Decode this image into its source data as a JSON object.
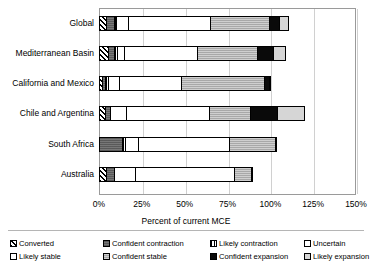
{
  "chart": {
    "type": "bar",
    "title": "",
    "xlabel": "Percent of current MCE",
    "ylabel": "",
    "orientation": "horizontal-stacked"
  },
  "axis": {
    "x_ticks": [
      "0%",
      "25%",
      "50%",
      "75%",
      "100%",
      "125%",
      "150%"
    ],
    "x_tick_values": [
      0,
      25,
      50,
      75,
      100,
      125,
      150
    ],
    "xlim": [
      0,
      150
    ],
    "grid": "vertical"
  },
  "legend": {
    "items": [
      {
        "label": "Converted",
        "key": "converted",
        "pattern": "diagonal-hatch",
        "color": "#ffffff"
      },
      {
        "label": "Confident contraction",
        "key": "confident_contraction",
        "pattern": "dark-gray-fine",
        "color": "#777777"
      },
      {
        "label": "Likely contraction",
        "key": "likely_contraction",
        "pattern": "vertical-hatch",
        "color": "#ffffff"
      },
      {
        "label": "Uncertain",
        "key": "uncertain",
        "pattern": "solid-white",
        "color": "#ffffff"
      },
      {
        "label": "Likely stable",
        "key": "likely_stable",
        "pattern": "solid-white",
        "color": "#ffffff"
      },
      {
        "label": "Confident stable",
        "key": "confident_stable",
        "pattern": "mid-gray-fine",
        "color": "#a8a8a8"
      },
      {
        "label": "Confident expansion",
        "key": "confident_expansion",
        "pattern": "solid-black",
        "color": "#0a0a0a"
      },
      {
        "label": "Likely expansion",
        "key": "likely_expansion",
        "pattern": "light-gray",
        "color": "#d6d6d6"
      }
    ]
  },
  "chart_data": {
    "type": "bar",
    "title": "",
    "xlabel": "Percent of current MCE",
    "ylabel": "",
    "xlim": [
      0,
      150
    ],
    "grid": true,
    "legend_position": "bottom",
    "stacked": true,
    "orientation": "horizontal",
    "categories": [
      "Global",
      "Mediterranean Basin",
      "California and Mexico",
      "Chile and Argentina",
      "South Africa",
      "Australia"
    ],
    "series": [
      {
        "name": "Converted",
        "values": [
          4.0,
          5.0,
          2.0,
          3.5,
          0.0,
          4.0
        ]
      },
      {
        "name": "Confident contraction",
        "values": [
          4.5,
          4.0,
          1.5,
          3.0,
          13.5,
          5.0
        ]
      },
      {
        "name": "Likely contraction",
        "values": [
          1.5,
          1.5,
          1.5,
          0.0,
          1.5,
          0.0
        ]
      },
      {
        "name": "Uncertain",
        "values": [
          7.0,
          4.0,
          6.5,
          9.0,
          8.0,
          12.0
        ]
      },
      {
        "name": "Likely stable",
        "values": [
          48.0,
          43.0,
          36.5,
          48.5,
          53.0,
          58.0
        ]
      },
      {
        "name": "Confident stable",
        "values": [
          34.0,
          35.0,
          48.5,
          24.0,
          26.5,
          9.5
        ]
      },
      {
        "name": "Confident expansion",
        "values": [
          6.0,
          9.0,
          2.5,
          16.0,
          1.0,
          1.5
        ]
      },
      {
        "name": "Likely expansion",
        "values": [
          6.0,
          7.5,
          1.0,
          16.0,
          0.0,
          0.0
        ]
      }
    ],
    "totals": [
      111.0,
      109.0,
      100.0,
      140.0,
      103.5,
      90.0
    ]
  },
  "bars": [
    {
      "category": "Global",
      "segments": [
        {
          "key": "converted",
          "value": 4.0
        },
        {
          "key": "confident_contraction",
          "value": 4.5
        },
        {
          "key": "likely_contraction",
          "value": 1.5
        },
        {
          "key": "uncertain",
          "value": 7.0
        },
        {
          "key": "likely_stable",
          "value": 48.0
        },
        {
          "key": "confident_stable",
          "value": 34.0
        },
        {
          "key": "confident_expansion",
          "value": 6.0
        },
        {
          "key": "likely_expansion",
          "value": 6.0
        }
      ]
    },
    {
      "category": "Mediterranean Basin",
      "segments": [
        {
          "key": "converted",
          "value": 5.0
        },
        {
          "key": "confident_contraction",
          "value": 4.0
        },
        {
          "key": "likely_contraction",
          "value": 1.5
        },
        {
          "key": "uncertain",
          "value": 4.0
        },
        {
          "key": "likely_stable",
          "value": 43.0
        },
        {
          "key": "confident_stable",
          "value": 35.0
        },
        {
          "key": "confident_expansion",
          "value": 9.0
        },
        {
          "key": "likely_expansion",
          "value": 7.5
        }
      ]
    },
    {
      "category": "California and Mexico",
      "segments": [
        {
          "key": "converted",
          "value": 2.0
        },
        {
          "key": "confident_contraction",
          "value": 1.5
        },
        {
          "key": "likely_contraction",
          "value": 1.5
        },
        {
          "key": "uncertain",
          "value": 6.5
        },
        {
          "key": "likely_stable",
          "value": 36.5
        },
        {
          "key": "confident_stable",
          "value": 48.5
        },
        {
          "key": "confident_expansion",
          "value": 2.5
        },
        {
          "key": "likely_expansion",
          "value": 1.0
        }
      ]
    },
    {
      "category": "Chile and Argentina",
      "segments": [
        {
          "key": "converted",
          "value": 3.5
        },
        {
          "key": "confident_contraction",
          "value": 3.0
        },
        {
          "key": "likely_contraction",
          "value": 0.0
        },
        {
          "key": "uncertain",
          "value": 9.0
        },
        {
          "key": "likely_stable",
          "value": 48.5
        },
        {
          "key": "confident_stable",
          "value": 24.0
        },
        {
          "key": "confident_expansion",
          "value": 16.0
        },
        {
          "key": "likely_expansion",
          "value": 16.0
        }
      ]
    },
    {
      "category": "South Africa",
      "segments": [
        {
          "key": "converted",
          "value": 0.0
        },
        {
          "key": "confident_contraction",
          "value": 13.5
        },
        {
          "key": "likely_contraction",
          "value": 1.5
        },
        {
          "key": "uncertain",
          "value": 8.0
        },
        {
          "key": "likely_stable",
          "value": 53.0
        },
        {
          "key": "confident_stable",
          "value": 26.5
        },
        {
          "key": "confident_expansion",
          "value": 1.0
        },
        {
          "key": "likely_expansion",
          "value": 0.0
        }
      ]
    },
    {
      "category": "Australia",
      "segments": [
        {
          "key": "converted",
          "value": 4.0
        },
        {
          "key": "confident_contraction",
          "value": 5.0
        },
        {
          "key": "likely_contraction",
          "value": 0.0
        },
        {
          "key": "uncertain",
          "value": 12.0
        },
        {
          "key": "likely_stable",
          "value": 58.0
        },
        {
          "key": "confident_stable",
          "value": 9.5
        },
        {
          "key": "confident_expansion",
          "value": 1.5
        },
        {
          "key": "likely_expansion",
          "value": 0.0
        }
      ]
    }
  ]
}
